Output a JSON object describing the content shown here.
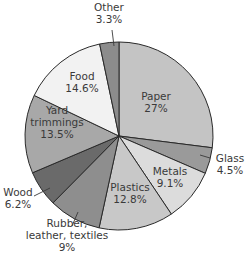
{
  "chart_data": {
    "type": "pie",
    "title": "",
    "start_angle_deg": 0,
    "direction": "clockwise",
    "center": [
      119,
      136
    ],
    "radius": 94,
    "slices": [
      {
        "name": "Paper",
        "value": 27,
        "label_lines": [
          "Paper",
          "27%"
        ],
        "color": "#c4c4c4",
        "label_pos": [
          156,
          102
        ],
        "inside": true
      },
      {
        "name": "Glass",
        "value": 4.5,
        "label_lines": [
          "Glass",
          "4.5%"
        ],
        "color": "#9a9a9a",
        "label_pos": [
          230,
          164
        ],
        "inside": false,
        "leader": [
          [
            210,
            158
          ],
          [
            200,
            155
          ]
        ]
      },
      {
        "name": "Metals",
        "value": 9.1,
        "label_lines": [
          "Metals",
          "9.1%"
        ],
        "color": "#dcdcdc",
        "label_pos": [
          170,
          177
        ],
        "inside": true
      },
      {
        "name": "Plastics",
        "value": 12.8,
        "label_lines": [
          "Plastics",
          "12.8%"
        ],
        "color": "#c8c8c8",
        "label_pos": [
          130,
          193
        ],
        "inside": true
      },
      {
        "name": "Rubber, leather, textiles",
        "value": 9,
        "label_lines": [
          "Rubber,",
          "leather, textiles",
          "9%"
        ],
        "color": "#8e8e8e",
        "label_pos": [
          67,
          235
        ],
        "inside": false,
        "leader": [
          [
            72,
            226
          ],
          [
            78,
            212
          ]
        ]
      },
      {
        "name": "Wood",
        "value": 6.2,
        "label_lines": [
          "Wood",
          "6.2%"
        ],
        "color": "#6a6a6a",
        "label_pos": [
          18,
          198
        ],
        "inside": false,
        "leader": [
          [
            34,
            196
          ],
          [
            50,
            188
          ]
        ]
      },
      {
        "name": "Yard trimmings",
        "value": 13.5,
        "label_lines": [
          "Yard",
          "trimmings",
          "13.5%"
        ],
        "color": "#a8a8a8",
        "label_pos": [
          57,
          122
        ],
        "inside": true
      },
      {
        "name": "Food",
        "value": 14.6,
        "label_lines": [
          "Food",
          "14.6%"
        ],
        "color": "#f2f2f2",
        "label_pos": [
          82,
          82
        ],
        "inside": true
      },
      {
        "name": "Other",
        "value": 3.3,
        "label_lines": [
          "Other",
          "3.3%"
        ],
        "color": "#8c8c8c",
        "label_pos": [
          109,
          13
        ],
        "inside": false,
        "leader": [
          [
            112,
            30
          ],
          [
            114,
            46
          ]
        ]
      }
    ],
    "categories": [
      "Paper",
      "Glass",
      "Metals",
      "Plastics",
      "Rubber, leather, textiles",
      "Wood",
      "Yard trimmings",
      "Food",
      "Other"
    ],
    "values": [
      27,
      4.5,
      9.1,
      12.8,
      9,
      6.2,
      13.5,
      14.6,
      3.3
    ],
    "legend": "none (labels on/around slices)"
  }
}
